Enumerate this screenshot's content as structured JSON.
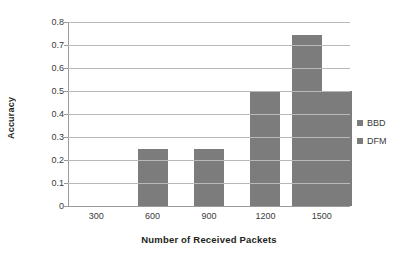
{
  "chart_data": {
    "type": "bar",
    "title": "",
    "xlabel": "Number of Received Packets",
    "ylabel": "Accuracy",
    "categories": [
      "300",
      "600",
      "900",
      "1200",
      "1500"
    ],
    "series": [
      {
        "name": "BBD",
        "values": [
          0,
          0.25,
          0.25,
          0.5,
          0.745
        ]
      },
      {
        "name": "DFM",
        "values": [
          0,
          0,
          0,
          0,
          0.5
        ]
      }
    ],
    "ylim": [
      0,
      0.8
    ],
    "ytick_labels": [
      "0",
      "0.1",
      "0.2",
      "0.3",
      "0.4",
      "0.5",
      "0.6",
      "0.7",
      "0.8"
    ],
    "ytick_values": [
      0,
      0.1,
      0.2,
      0.3,
      0.4,
      0.5,
      0.6,
      0.7,
      0.8
    ],
    "grid": true,
    "legend_position": "right",
    "bar_color": "#7c7c7c",
    "gridline_color": "#b9b9b9",
    "axis_color": "#9a9a9a"
  }
}
